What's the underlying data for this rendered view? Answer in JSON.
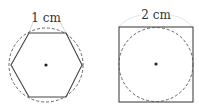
{
  "figures": [
    {
      "shape": "hexagon",
      "label": "1 cm",
      "inscribed": "dashed-circle"
    },
    {
      "shape": "square",
      "label": "2 cm",
      "inscribed": "dashed-circle"
    }
  ],
  "colors": {
    "stroke": "#444444",
    "dashed": "#555555",
    "guide": "#cccccc"
  }
}
